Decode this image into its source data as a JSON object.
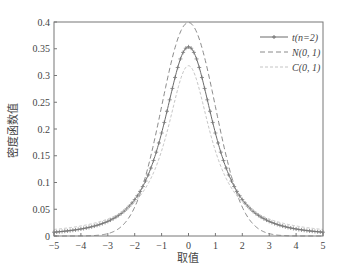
{
  "chart_data": {
    "type": "line",
    "title": "",
    "xlabel": "取值",
    "ylabel": "密度函数值",
    "xlim": [
      -5,
      5
    ],
    "ylim": [
      0,
      0.4
    ],
    "xticks": [
      -5,
      -4,
      -3,
      -2,
      -1,
      0,
      1,
      2,
      3,
      4,
      5
    ],
    "yticks": [
      0,
      0.05,
      0.1,
      0.15,
      0.2,
      0.25,
      0.3,
      0.35,
      0.4
    ],
    "ytick_labels": [
      "0",
      "0.05",
      "0.1",
      "0.15",
      "0.2",
      "0.25",
      "0.3",
      "0.35",
      "0.4"
    ],
    "grid": false,
    "legend_position": "upper right",
    "series": [
      {
        "name": "t(n=2)",
        "style": "solid-with-markers",
        "color": "#666666",
        "peak": 0.354,
        "x": [
          -5,
          -4,
          -3,
          -2,
          -1,
          0,
          1,
          2,
          3,
          4,
          5
        ],
        "values": [
          0.0071,
          0.0131,
          0.0274,
          0.068,
          0.1925,
          0.3536,
          0.1925,
          0.068,
          0.0274,
          0.0131,
          0.0071
        ]
      },
      {
        "name": "N(0, 1)",
        "style": "dashed",
        "color": "#888888",
        "peak": 0.399,
        "x": [
          -5,
          -4,
          -3,
          -2,
          -1,
          0,
          1,
          2,
          3,
          4,
          5
        ],
        "values": [
          1.5e-06,
          0.0001,
          0.0044,
          0.054,
          0.242,
          0.3989,
          0.242,
          0.054,
          0.0044,
          0.0001,
          1.5e-06
        ]
      },
      {
        "name": "C(0, 1)",
        "style": "dotted-light",
        "color": "#bbbbbb",
        "peak": 0.318,
        "x": [
          -5,
          -4,
          -3,
          -2,
          -1,
          0,
          1,
          2,
          3,
          4,
          5
        ],
        "values": [
          0.0122,
          0.0187,
          0.0318,
          0.0637,
          0.1592,
          0.3183,
          0.1592,
          0.0637,
          0.0318,
          0.0187,
          0.0122
        ]
      }
    ]
  },
  "legend": {
    "items": [
      {
        "label": "t(n=2)"
      },
      {
        "label": "N(0, 1)"
      },
      {
        "label": "C(0, 1)"
      }
    ]
  }
}
